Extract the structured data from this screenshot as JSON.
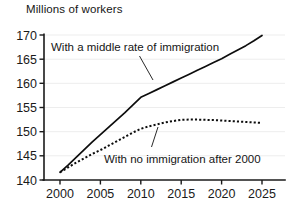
{
  "chart_data": {
    "type": "line",
    "title": "",
    "ylabel": "Millions of workers",
    "xlabel": "",
    "xlim": [
      2000,
      2026
    ],
    "ylim": [
      140,
      170
    ],
    "grid": true,
    "legend_position": "inline-annotations",
    "xticks": [
      "2000",
      "2005",
      "2010",
      "2015",
      "2020",
      "2025"
    ],
    "yticks": [
      "140",
      "145",
      "150",
      "155",
      "160",
      "165",
      "170"
    ],
    "x": [
      2000,
      2001,
      2002,
      2003,
      2004,
      2005,
      2006,
      2007,
      2008,
      2009,
      2010,
      2011,
      2012,
      2013,
      2014,
      2015,
      2016,
      2017,
      2018,
      2019,
      2020,
      2021,
      2022,
      2023,
      2024,
      2025
    ],
    "series": [
      {
        "name": "With a middle rate of immigration",
        "style": "solid",
        "values": [
          141.6,
          143.1,
          144.7,
          146.3,
          147.9,
          149.4,
          150.9,
          152.4,
          153.9,
          155.5,
          157.1,
          157.9,
          158.7,
          159.5,
          160.3,
          161.1,
          161.9,
          162.7,
          163.5,
          164.3,
          165.1,
          166.0,
          166.9,
          167.8,
          168.8,
          169.9
        ]
      },
      {
        "name": "With no immigration after 2000",
        "style": "dotted",
        "values": [
          141.6,
          142.6,
          143.6,
          144.5,
          145.4,
          146.2,
          147.1,
          148.0,
          148.9,
          149.8,
          150.6,
          151.1,
          151.5,
          151.9,
          152.2,
          152.45,
          152.5,
          152.5,
          152.45,
          152.4,
          152.3,
          152.2,
          152.1,
          152.0,
          151.9,
          151.8
        ]
      }
    ],
    "annotations": [
      {
        "text": "With a middle rate of immigration",
        "target_year": 2012,
        "target_value": 158.5
      },
      {
        "text": "With no immigration after 2000",
        "target_year": 2013,
        "target_value": 151.5
      }
    ]
  },
  "colors": {
    "line": "#0d0d0d",
    "grid": "#ededed",
    "axis": "#1a1a1a",
    "background": "#ffffff"
  }
}
